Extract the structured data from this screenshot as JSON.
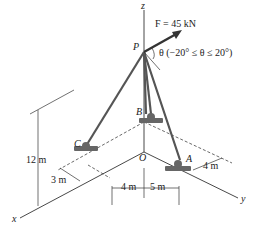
{
  "diagram": {
    "type": "3D statics tripod / guy-wire diagram",
    "axes": {
      "x": "x",
      "y": "y",
      "z": "z",
      "origin": "O"
    },
    "points": {
      "P": "P",
      "A": "A",
      "B": "B",
      "C": "C"
    },
    "force": {
      "label": "F = 45 kN",
      "angle_label": "θ (−20° ≤ θ ≤ 20°)"
    },
    "dimensions": {
      "height": "12 m",
      "c_offset": "3 m",
      "a_offset": "4 m",
      "left_span": "4 m",
      "right_span": "5 m"
    },
    "colors": {
      "line": "#333333",
      "support": "#555555",
      "background": "#ffffff"
    }
  }
}
